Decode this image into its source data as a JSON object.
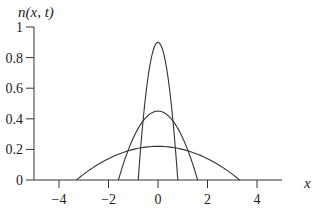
{
  "chart_data": {
    "type": "line",
    "title": "",
    "xlabel": "x",
    "ylabel": "n(x, t)",
    "xlim": [
      -5,
      5
    ],
    "ylim": [
      0,
      1
    ],
    "xticks": [
      -4,
      -2,
      0,
      2,
      4
    ],
    "yticks": [
      0,
      0.2,
      0.4,
      0.6,
      0.8,
      1
    ],
    "xtick_labels": [
      "−4",
      "−2",
      "0",
      "2",
      "4"
    ],
    "ytick_labels": [
      "0",
      "0.2",
      "0.4",
      "0.6",
      "0.8",
      "1"
    ],
    "grid": false,
    "legend": null,
    "series": [
      {
        "name": "narrow profile",
        "shape": "parabola",
        "peak": 0.9,
        "support": [
          -0.8,
          0.8
        ]
      },
      {
        "name": "medium profile",
        "shape": "parabola",
        "peak": 0.45,
        "support": [
          -1.6,
          1.6
        ]
      },
      {
        "name": "wide profile",
        "shape": "parabola",
        "peak": 0.22,
        "support": [
          -3.3,
          3.3
        ]
      }
    ],
    "color": "#333333"
  },
  "labels": {
    "ylabel": "n(x, t)",
    "xlabel": "x"
  }
}
